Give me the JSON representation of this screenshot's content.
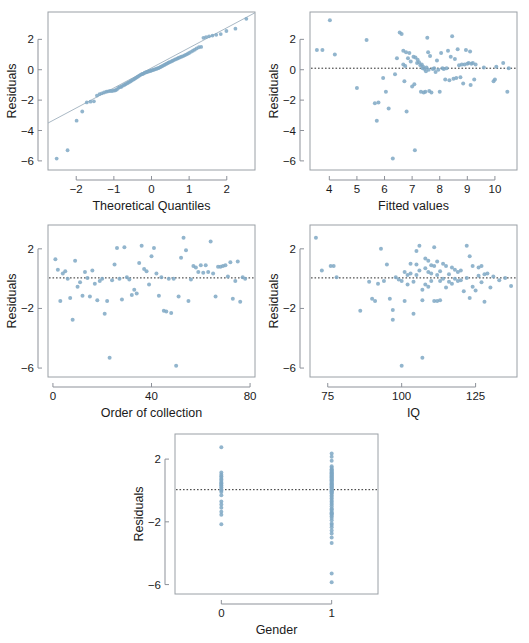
{
  "figure": {
    "panel_count": 5,
    "point_color": "#7fa8c4",
    "frame_color": "#9aa0a6",
    "reference_line_color": "#2b2b2b"
  },
  "chart_data": [
    {
      "id": "qq-plot",
      "type": "scatter",
      "title": "",
      "xlabel": "Theoretical Quantiles",
      "ylabel": "Residuals",
      "xlim": [
        -2.75,
        2.75
      ],
      "ylim": [
        -6.6,
        3.8
      ],
      "xticks": [
        -2,
        -1,
        0,
        1,
        2
      ],
      "xticklabels": [
        "−2",
        "−1",
        "0",
        "1",
        "2"
      ],
      "yticks": [
        2,
        0,
        -2,
        -4,
        -6
      ],
      "yticklabels": [
        "2",
        "0",
        "−2",
        "−4",
        "−6"
      ],
      "grid": false,
      "reference_line": {
        "kind": "qq-line",
        "slope": 1.32,
        "intercept": 0.12
      },
      "x": [
        -2.52,
        -2.23,
        -1.99,
        -1.84,
        -1.72,
        -1.62,
        -1.53,
        -1.45,
        -1.38,
        -1.32,
        -1.26,
        -1.2,
        -1.15,
        -1.1,
        -1.05,
        -1.0,
        -0.96,
        -0.92,
        -0.88,
        -0.84,
        -0.8,
        -0.76,
        -0.72,
        -0.69,
        -0.65,
        -0.62,
        -0.58,
        -0.55,
        -0.52,
        -0.48,
        -0.45,
        -0.42,
        -0.39,
        -0.36,
        -0.33,
        -0.3,
        -0.27,
        -0.24,
        -0.21,
        -0.18,
        -0.15,
        -0.12,
        -0.09,
        -0.06,
        -0.03,
        0.0,
        0.03,
        0.06,
        0.09,
        0.12,
        0.15,
        0.18,
        0.21,
        0.24,
        0.27,
        0.3,
        0.33,
        0.36,
        0.39,
        0.42,
        0.45,
        0.48,
        0.52,
        0.55,
        0.58,
        0.62,
        0.65,
        0.69,
        0.72,
        0.76,
        0.8,
        0.84,
        0.88,
        0.92,
        0.96,
        1.0,
        1.05,
        1.1,
        1.15,
        1.2,
        1.26,
        1.32,
        1.38,
        1.45,
        1.53,
        1.62,
        1.72,
        1.84,
        1.99,
        2.23,
        2.52
      ],
      "y": [
        -5.85,
        -5.3,
        -3.35,
        -2.75,
        -2.15,
        -2.1,
        -2.08,
        -1.7,
        -1.6,
        -1.55,
        -1.5,
        -1.45,
        -1.42,
        -1.4,
        -1.4,
        -1.38,
        -1.35,
        -1.3,
        -1.2,
        -1.15,
        -1.12,
        -1.05,
        -1.0,
        -0.95,
        -0.9,
        -0.85,
        -0.8,
        -0.75,
        -0.7,
        -0.65,
        -0.6,
        -0.55,
        -0.5,
        -0.45,
        -0.4,
        -0.35,
        -0.3,
        -0.28,
        -0.25,
        -0.2,
        -0.18,
        -0.15,
        -0.12,
        -0.1,
        -0.08,
        -0.05,
        -0.02,
        0.0,
        0.03,
        0.05,
        0.08,
        0.1,
        0.14,
        0.18,
        0.22,
        0.26,
        0.3,
        0.34,
        0.38,
        0.42,
        0.46,
        0.5,
        0.54,
        0.58,
        0.62,
        0.66,
        0.7,
        0.74,
        0.78,
        0.82,
        0.86,
        0.9,
        0.95,
        1.0,
        1.05,
        1.1,
        1.18,
        1.25,
        1.32,
        1.4,
        1.48,
        1.5,
        2.1,
        2.15,
        2.2,
        2.25,
        2.3,
        2.35,
        2.55,
        2.7,
        3.35
      ]
    },
    {
      "id": "residuals-vs-fitted",
      "type": "scatter",
      "title": "",
      "xlabel": "Fitted values",
      "ylabel": "Residuals",
      "xlim": [
        3.3,
        10.8
      ],
      "ylim": [
        -6.6,
        3.8
      ],
      "xticks": [
        4,
        5,
        6,
        7,
        8,
        9,
        10
      ],
      "xticklabels": [
        "4",
        "5",
        "6",
        "7",
        "8",
        "9",
        "10"
      ],
      "yticks": [
        2,
        0,
        -2,
        -4,
        -6
      ],
      "yticklabels": [
        "2",
        "0",
        "−2",
        "−4",
        "−6"
      ],
      "grid": false,
      "reference_line": {
        "kind": "horizontal",
        "y": 0.1
      },
      "x": [
        3.55,
        3.75,
        4.02,
        4.2,
        5.0,
        5.35,
        5.65,
        5.72,
        5.78,
        5.95,
        6.05,
        6.15,
        6.3,
        6.38,
        6.45,
        6.55,
        6.62,
        6.68,
        6.68,
        6.72,
        6.75,
        6.78,
        6.8,
        6.85,
        6.9,
        6.95,
        7.0,
        7.05,
        7.08,
        7.1,
        7.12,
        7.18,
        7.2,
        7.25,
        7.3,
        7.32,
        7.35,
        7.38,
        7.4,
        7.42,
        7.45,
        7.48,
        7.5,
        7.52,
        7.55,
        7.58,
        7.6,
        7.62,
        7.65,
        7.7,
        7.75,
        7.8,
        7.85,
        7.9,
        7.95,
        8.0,
        8.05,
        8.1,
        8.15,
        8.2,
        8.25,
        8.3,
        8.35,
        8.4,
        8.45,
        8.5,
        8.55,
        8.6,
        8.65,
        8.7,
        8.75,
        8.8,
        8.85,
        8.9,
        8.95,
        9.0,
        9.05,
        9.1,
        9.12,
        9.15,
        9.2,
        9.25,
        9.3,
        9.6,
        9.95,
        10.0,
        10.05,
        10.3,
        10.45,
        10.5
      ],
      "y": [
        1.3,
        1.3,
        3.25,
        1.0,
        -1.2,
        1.95,
        -2.2,
        -3.35,
        -2.15,
        -0.55,
        -1.45,
        -2.55,
        -5.85,
        -0.3,
        0.75,
        2.45,
        2.35,
        1.25,
        0.35,
        -0.75,
        0.25,
        1.15,
        -2.75,
        0.75,
        1.1,
        0.55,
        -1.1,
        0.85,
        -0.95,
        -5.3,
        0.8,
        0.45,
        0.65,
        0.5,
        0.3,
        -1.45,
        0.35,
        0.1,
        0.2,
        -1.5,
        0.05,
        -1.45,
        -0.1,
        0.15,
        2.1,
        1.15,
        0.0,
        -1.4,
        0.9,
        -1.5,
        0.05,
        0.1,
        -0.15,
        0.6,
        0.0,
        -1.45,
        1.1,
        0.1,
        0.05,
        -0.65,
        0.1,
        1.25,
        -0.7,
        0.85,
        2.2,
        -0.6,
        0.7,
        -0.55,
        1.35,
        0.3,
        -0.5,
        0.35,
        -0.9,
        0.35,
        1.3,
        0.4,
        0.45,
        1.2,
        -1.0,
        0.4,
        0.45,
        -0.65,
        0.35,
        0.15,
        -0.75,
        -0.65,
        0.2,
        0.45,
        -1.45,
        0.1
      ]
    },
    {
      "id": "residuals-vs-order",
      "type": "scatter",
      "title": "",
      "xlabel": "Order of collection",
      "ylabel": "Residuals",
      "xlim": [
        -2,
        82
      ],
      "ylim": [
        -6.6,
        3.6
      ],
      "xticks": [
        0,
        40,
        80
      ],
      "xticklabels": [
        "0",
        "40",
        "80"
      ],
      "yticks": [
        2,
        -2,
        -6
      ],
      "yticklabels": [
        "2",
        "−2",
        "−6"
      ],
      "grid": false,
      "reference_line": {
        "kind": "horizontal",
        "y": 0.05
      },
      "x": [
        1,
        2,
        3,
        4,
        5,
        6,
        7,
        8,
        9,
        10,
        11,
        12,
        13,
        14,
        15,
        16,
        17,
        18,
        19,
        20,
        21,
        22,
        23,
        24,
        25,
        26,
        27,
        28,
        29,
        30,
        31,
        32,
        33,
        34,
        35,
        36,
        37,
        38,
        39,
        40,
        41,
        42,
        43,
        44,
        45,
        46,
        47,
        48,
        49,
        50,
        51,
        52,
        53,
        54,
        55,
        56,
        57,
        58,
        59,
        60,
        61,
        62,
        63,
        64,
        65,
        66,
        67,
        68,
        69,
        70,
        71,
        72,
        73,
        74,
        75,
        76,
        77,
        78
      ],
      "y": [
        1.3,
        0.6,
        -1.5,
        0.35,
        0.5,
        0.0,
        -1.3,
        -2.75,
        1.2,
        -0.55,
        -0.25,
        -1.15,
        0.45,
        0.05,
        -1.2,
        0.55,
        -0.35,
        -1.45,
        -0.15,
        0.0,
        -2.35,
        -1.5,
        -5.3,
        -0.1,
        0.95,
        2.05,
        0.0,
        -1.4,
        2.1,
        0.1,
        -0.05,
        -1.1,
        -0.75,
        -1.0,
        1.05,
        2.2,
        0.65,
        0.5,
        -0.4,
        1.5,
        2.05,
        0.35,
        -1.15,
        0.1,
        -2.15,
        -2.2,
        0.0,
        -2.3,
        0.0,
        -5.85,
        -1.2,
        1.4,
        2.75,
        1.9,
        -1.5,
        -0.05,
        0.85,
        0.75,
        0.45,
        0.9,
        0.4,
        0.9,
        0.45,
        2.5,
        0.35,
        -1.2,
        0.8,
        0.8,
        0.85,
        0.9,
        0.15,
        1.1,
        -1.35,
        -0.15,
        1.15,
        -1.55,
        0.1,
        0.0
      ]
    },
    {
      "id": "residuals-vs-iq",
      "type": "scatter",
      "title": "",
      "xlabel": "IQ",
      "ylabel": "Residuals",
      "xlim": [
        69,
        139
      ],
      "ylim": [
        -6.6,
        3.6
      ],
      "xticks": [
        75,
        100,
        125
      ],
      "xticklabels": [
        "75",
        "100",
        "125"
      ],
      "yticks": [
        2,
        -2,
        -6
      ],
      "yticklabels": [
        "2",
        "−2",
        "−6"
      ],
      "grid": false,
      "reference_line": {
        "kind": "horizontal",
        "y": 0.05
      },
      "x": [
        71,
        73,
        76,
        77,
        78,
        86,
        89,
        90,
        91,
        92,
        93,
        94,
        95,
        96,
        97,
        97,
        98,
        99,
        100,
        100,
        101,
        101,
        102,
        102,
        103,
        103,
        104,
        104,
        105,
        105,
        105,
        106,
        106,
        107,
        107,
        107,
        108,
        108,
        108,
        109,
        109,
        109,
        110,
        110,
        110,
        111,
        111,
        111,
        112,
        112,
        112,
        113,
        113,
        113,
        114,
        114,
        115,
        115,
        116,
        116,
        117,
        117,
        118,
        118,
        119,
        119,
        120,
        120,
        121,
        122,
        122,
        123,
        123,
        124,
        124,
        125,
        126,
        126,
        127,
        127,
        128,
        128,
        129,
        130,
        131,
        133,
        135,
        137
      ],
      "y": [
        2.75,
        0.55,
        0.85,
        0.85,
        0.1,
        -2.15,
        -0.2,
        -1.35,
        -1.5,
        -0.35,
        2.0,
        -0.15,
        0.95,
        -1.35,
        -2.75,
        -2.1,
        0.1,
        -0.05,
        -5.85,
        -0.15,
        -1.5,
        0.45,
        -0.4,
        0.25,
        1.0,
        0.35,
        -2.35,
        -0.2,
        1.85,
        0.95,
        0.25,
        2.2,
        0.55,
        -0.75,
        -1.45,
        -5.3,
        1.35,
        0.7,
        -0.4,
        1.2,
        0.45,
        -0.55,
        0.9,
        0.35,
        -0.15,
        2.1,
        0.85,
        -1.5,
        1.15,
        0.25,
        -1.5,
        0.5,
        -0.15,
        -1.45,
        1.0,
        0.0,
        0.85,
        -0.6,
        0.3,
        -0.2,
        0.75,
        -0.35,
        0.6,
        0.0,
        0.45,
        -0.15,
        0.55,
        -0.1,
        -0.85,
        2.2,
        0.05,
        1.5,
        -1.3,
        0.85,
        -0.55,
        -0.8,
        0.75,
        0.2,
        0.85,
        -0.25,
        0.3,
        -1.55,
        0.35,
        -0.6,
        0.15,
        -0.1,
        0.05,
        -0.5
      ]
    },
    {
      "id": "residuals-vs-gender",
      "type": "scatter",
      "title": "",
      "xlabel": "Gender",
      "ylabel": "Residuals",
      "xlim": [
        -0.42,
        1.42
      ],
      "ylim": [
        -6.6,
        3.6
      ],
      "xticks": [
        0,
        1
      ],
      "xticklabels": [
        "0",
        "1"
      ],
      "yticks": [
        2,
        -2,
        -6
      ],
      "yticklabels": [
        "2",
        "−2",
        "−6"
      ],
      "grid": false,
      "reference_line": {
        "kind": "horizontal",
        "y": 0.05
      },
      "x": [
        0,
        0,
        0,
        0,
        0,
        0,
        0,
        0,
        0,
        0,
        0,
        0,
        0,
        0,
        0,
        0,
        0,
        0,
        0,
        0,
        0,
        0,
        1,
        1,
        1,
        1,
        1,
        1,
        1,
        1,
        1,
        1,
        1,
        1,
        1,
        1,
        1,
        1,
        1,
        1,
        1,
        1,
        1,
        1,
        1,
        1,
        1,
        1,
        1,
        1,
        1,
        1,
        1,
        1,
        1,
        1,
        1,
        1,
        1,
        1,
        1,
        1,
        1,
        1,
        1,
        1,
        1,
        1,
        1,
        1,
        1,
        1,
        1,
        1,
        1,
        1,
        1,
        1,
        1,
        1,
        1,
        1,
        1,
        1,
        1,
        1
      ],
      "y": [
        2.75,
        1.15,
        1.0,
        0.9,
        0.8,
        0.7,
        0.6,
        0.5,
        0.45,
        0.35,
        0.3,
        0.2,
        0.1,
        0.0,
        -0.1,
        -0.3,
        -0.7,
        -0.9,
        -1.1,
        -1.35,
        -1.55,
        -2.15,
        2.35,
        2.15,
        1.9,
        1.55,
        1.45,
        1.35,
        1.3,
        1.25,
        1.2,
        1.15,
        1.1,
        1.05,
        1.0,
        0.95,
        0.9,
        0.85,
        0.8,
        0.75,
        0.7,
        0.65,
        0.6,
        0.55,
        0.5,
        0.45,
        0.4,
        0.35,
        0.3,
        0.25,
        0.2,
        0.15,
        0.1,
        0.05,
        0.0,
        -0.05,
        -0.1,
        -0.15,
        -0.2,
        -0.3,
        -0.4,
        -0.5,
        -0.6,
        -0.7,
        -0.8,
        -0.9,
        -1.0,
        -1.15,
        -1.3,
        -1.4,
        -1.45,
        -1.5,
        -1.55,
        -1.65,
        -1.75,
        -1.9,
        -2.1,
        -2.2,
        -2.35,
        -2.55,
        -2.75,
        -3.0,
        -3.35,
        -5.3,
        -5.85,
        -1.2
      ]
    }
  ]
}
